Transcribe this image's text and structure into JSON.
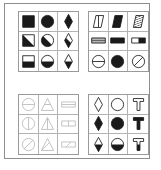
{
  "figure": {
    "panel_border_color": "#8d8d8d",
    "matrix_border_color": "#9a9a9a",
    "cell_divider_color": "#b3b3b3",
    "ink_dark": "#1a1a1a",
    "ink_light": "#b9b9b9",
    "matrices": [
      {
        "id": "matrix-top-left",
        "position": "top-left",
        "row_labels": [
          "solid-fill",
          "diagonal-half-fill",
          "bottom-half-fill"
        ],
        "column_labels": [
          "square",
          "circle",
          "diamond"
        ],
        "stroke": "#1a1a1a",
        "cells": [
          {
            "shape": "square",
            "fill": "solid",
            "name": "square-solid"
          },
          {
            "shape": "circle",
            "fill": "solid",
            "name": "circle-solid"
          },
          {
            "shape": "diamond",
            "fill": "solid",
            "name": "diamond-solid"
          },
          {
            "shape": "square",
            "fill": "diagonal-half",
            "name": "square-diagonal-half"
          },
          {
            "shape": "circle",
            "fill": "diagonal-half",
            "name": "circle-diagonal-half"
          },
          {
            "shape": "diamond",
            "fill": "diagonal-half",
            "name": "diamond-diagonal-half"
          },
          {
            "shape": "square",
            "fill": "bottom-half",
            "name": "square-bottom-half"
          },
          {
            "shape": "circle",
            "fill": "bottom-half",
            "name": "circle-bottom-half"
          },
          {
            "shape": "diamond",
            "fill": "bottom-half",
            "name": "diamond-bottom-half"
          }
        ]
      },
      {
        "id": "matrix-top-right",
        "position": "top-right",
        "row_labels": [
          "slanted-parallelogram",
          "horizontal-rectangle",
          "circle"
        ],
        "column_labels": [
          "outline-with-line",
          "solid-fill",
          "hatched-or-partial"
        ],
        "stroke": "#1a1a1a",
        "cells": [
          {
            "shape": "parallelogram",
            "fill": "outline-vertical-line",
            "name": "parallelogram-outline"
          },
          {
            "shape": "parallelogram",
            "fill": "solid",
            "name": "parallelogram-solid"
          },
          {
            "shape": "parallelogram",
            "fill": "hatched",
            "name": "parallelogram-hatched"
          },
          {
            "shape": "rectangle",
            "fill": "striped-horizontal",
            "name": "rectangle-striped"
          },
          {
            "shape": "rectangle",
            "fill": "solid",
            "name": "rectangle-solid"
          },
          {
            "shape": "rectangle",
            "fill": "right-half",
            "name": "rectangle-right-half"
          },
          {
            "shape": "circle",
            "fill": "outline-horizontal-line",
            "name": "circle-horizontal-line"
          },
          {
            "shape": "circle",
            "fill": "solid",
            "name": "circle-solid"
          },
          {
            "shape": "circle",
            "fill": "outline-diagonal-line",
            "name": "circle-diagonal-line"
          }
        ]
      },
      {
        "id": "matrix-bottom-left",
        "position": "bottom-left",
        "row_labels": [
          "horizontal-line",
          "vertical-line",
          "diagonal-line"
        ],
        "column_labels": [
          "circle",
          "triangle",
          "rectangle"
        ],
        "stroke": "#b9b9b9",
        "cells": [
          {
            "shape": "circle",
            "fill": "horizontal-line",
            "name": "circle-horizontal-line"
          },
          {
            "shape": "triangle",
            "fill": "horizontal-line",
            "name": "triangle-horizontal-line"
          },
          {
            "shape": "rectangle",
            "fill": "horizontal-line",
            "name": "rectangle-horizontal-line"
          },
          {
            "shape": "circle",
            "fill": "vertical-line",
            "name": "circle-vertical-line"
          },
          {
            "shape": "triangle",
            "fill": "vertical-line",
            "name": "triangle-vertical-line"
          },
          {
            "shape": "rectangle",
            "fill": "vertical-line",
            "name": "rectangle-vertical-line"
          },
          {
            "shape": "circle",
            "fill": "diagonal-line",
            "name": "circle-diagonal-line"
          },
          {
            "shape": "triangle",
            "fill": "diagonal-line",
            "name": "triangle-diagonal-line"
          },
          {
            "shape": "rectangle",
            "fill": "diagonal-line",
            "name": "rectangle-diagonal-line"
          }
        ]
      },
      {
        "id": "matrix-bottom-right",
        "position": "bottom-right",
        "row_labels": [
          "outline",
          "solid-fill",
          "bottom-half-fill"
        ],
        "column_labels": [
          "diamond",
          "circle",
          "t-shape"
        ],
        "stroke": "#1a1a1a",
        "cells": [
          {
            "shape": "diamond",
            "fill": "outline",
            "name": "diamond-outline"
          },
          {
            "shape": "circle",
            "fill": "outline",
            "name": "circle-outline"
          },
          {
            "shape": "tshape",
            "fill": "outline",
            "name": "tshape-outline"
          },
          {
            "shape": "diamond",
            "fill": "solid",
            "name": "diamond-solid"
          },
          {
            "shape": "circle",
            "fill": "solid",
            "name": "circle-solid"
          },
          {
            "shape": "tshape",
            "fill": "solid",
            "name": "tshape-solid"
          },
          {
            "shape": "diamond",
            "fill": "bottom-half",
            "name": "diamond-bottom-half"
          },
          {
            "shape": "circle",
            "fill": "bottom-half",
            "name": "circle-bottom-half"
          },
          {
            "shape": "tshape",
            "fill": "bottom-half",
            "name": "tshape-bottom-half"
          }
        ]
      }
    ]
  }
}
